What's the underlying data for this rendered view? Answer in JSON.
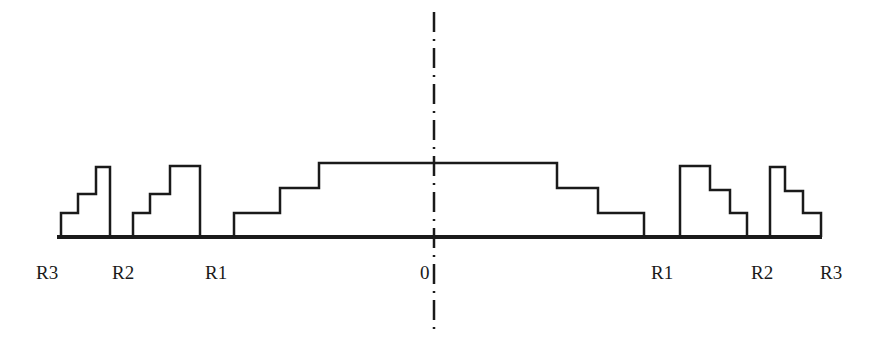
{
  "diagram": {
    "type": "stepped radial profile (symmetric about axis)",
    "axis_label": "0",
    "labels_left": [
      "R3",
      "R2",
      "R1"
    ],
    "labels_right": [
      "R1",
      "R2",
      "R3"
    ],
    "colors": {
      "stroke": "#1a1a1a",
      "background": "#ffffff"
    }
  }
}
